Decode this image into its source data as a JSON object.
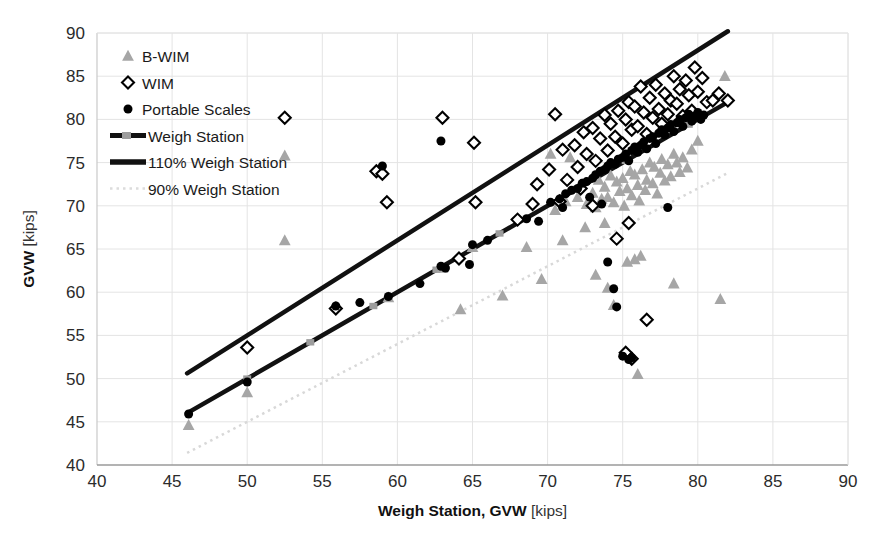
{
  "chart_data": {
    "type": "scatter",
    "title": "",
    "xlabel": "Weigh Station, GVW",
    "xlabel_unit": "[kips]",
    "ylabel": "GVW",
    "ylabel_unit": "[kips]",
    "xlim": [
      40,
      90
    ],
    "ylim": [
      40,
      90
    ],
    "xticks": [
      40,
      45,
      50,
      55,
      60,
      65,
      70,
      75,
      80,
      85,
      90
    ],
    "yticks": [
      40,
      45,
      50,
      55,
      60,
      65,
      70,
      75,
      80,
      85,
      90
    ],
    "grid": true,
    "legend_position": "upper-left",
    "legend": [
      {
        "label": "B-WIM",
        "marker": "triangle",
        "color": "#a6a6a6"
      },
      {
        "label": "WIM",
        "marker": "diamond-open",
        "color": "#000000"
      },
      {
        "label": "Portable Scales",
        "marker": "circle-filled",
        "color": "#000000"
      },
      {
        "label": "Weigh Station",
        "marker": "line-marker",
        "color": "#000000"
      },
      {
        "label": "110% Weigh Station",
        "marker": "line-thick",
        "color": "#000000"
      },
      {
        "label": "90% Weigh Station",
        "marker": "line-dotted",
        "color": "#d0d0d0"
      }
    ],
    "reference_lines": [
      {
        "name": "Weigh Station",
        "slope": 1.0,
        "intercept": 0,
        "x_range": [
          46,
          82
        ],
        "style": "solid-marker",
        "color": "#111111",
        "width": 4.5
      },
      {
        "name": "110% Weigh Station",
        "slope": 1.1,
        "intercept": 0,
        "x_range": [
          46,
          82
        ],
        "style": "solid",
        "color": "#111111",
        "width": 4.5
      },
      {
        "name": "90% Weigh Station",
        "slope": 0.9,
        "intercept": 0,
        "x_range": [
          46,
          82
        ],
        "style": "dotted",
        "color": "#d8d8d8",
        "width": 2.5
      }
    ],
    "series": [
      {
        "name": "B-WIM",
        "marker": "triangle",
        "color": "#a6a6a6",
        "points": [
          [
            46.1,
            44.6
          ],
          [
            50.0,
            48.4
          ],
          [
            52.5,
            66.0
          ],
          [
            52.5,
            75.8
          ],
          [
            59.4,
            59.4
          ],
          [
            63.0,
            62.8
          ],
          [
            65.0,
            65.2
          ],
          [
            68.6,
            65.2
          ],
          [
            70.2,
            76.0
          ],
          [
            70.5,
            69.5
          ],
          [
            71.2,
            70.5
          ],
          [
            71.5,
            75.6
          ],
          [
            72.0,
            71.0
          ],
          [
            72.3,
            72.5
          ],
          [
            72.6,
            70.2
          ],
          [
            73.0,
            71.5
          ],
          [
            73.2,
            69.8
          ],
          [
            73.4,
            73.0
          ],
          [
            73.6,
            70.8
          ],
          [
            73.8,
            72.2
          ],
          [
            74.0,
            71.0
          ],
          [
            74.2,
            73.5
          ],
          [
            74.4,
            70.4
          ],
          [
            74.6,
            72.8
          ],
          [
            74.8,
            71.7
          ],
          [
            75.0,
            73.2
          ],
          [
            75.1,
            70.0
          ],
          [
            75.3,
            72.0
          ],
          [
            75.5,
            74.0
          ],
          [
            75.6,
            71.2
          ],
          [
            75.8,
            73.6
          ],
          [
            76.0,
            72.4
          ],
          [
            76.1,
            70.6
          ],
          [
            76.3,
            74.2
          ],
          [
            76.5,
            71.8
          ],
          [
            76.6,
            73.0
          ],
          [
            76.8,
            75.0
          ],
          [
            77.0,
            72.6
          ],
          [
            77.1,
            74.5
          ],
          [
            77.3,
            71.4
          ],
          [
            77.5,
            73.8
          ],
          [
            77.6,
            75.4
          ],
          [
            77.8,
            72.9
          ],
          [
            78.0,
            74.8
          ],
          [
            78.2,
            73.4
          ],
          [
            78.4,
            76.0
          ],
          [
            78.6,
            75.0
          ],
          [
            78.8,
            73.9
          ],
          [
            79.0,
            75.6
          ],
          [
            79.3,
            74.4
          ],
          [
            79.6,
            76.5
          ],
          [
            80.0,
            77.5
          ],
          [
            81.8,
            85.0
          ],
          [
            73.2,
            62.0
          ],
          [
            74.0,
            60.5
          ],
          [
            74.4,
            58.5
          ],
          [
            75.3,
            63.5
          ],
          [
            75.8,
            63.8
          ],
          [
            76.2,
            64.2
          ],
          [
            76.0,
            50.5
          ],
          [
            78.4,
            61.0
          ],
          [
            81.5,
            59.2
          ],
          [
            72.5,
            67.5
          ],
          [
            73.8,
            68.0
          ],
          [
            71.0,
            66.0
          ],
          [
            69.6,
            61.5
          ],
          [
            67.0,
            59.6
          ],
          [
            64.2,
            58.0
          ]
        ]
      },
      {
        "name": "WIM",
        "marker": "diamond-open",
        "color": "#000000",
        "points": [
          [
            50.0,
            53.6
          ],
          [
            52.5,
            80.2
          ],
          [
            55.9,
            58.1
          ],
          [
            58.6,
            74.0
          ],
          [
            59.0,
            73.7
          ],
          [
            59.3,
            70.4
          ],
          [
            63.0,
            80.2
          ],
          [
            64.1,
            63.9
          ],
          [
            65.1,
            77.3
          ],
          [
            65.2,
            70.4
          ],
          [
            68.0,
            68.4
          ],
          [
            69.3,
            72.5
          ],
          [
            70.1,
            74.2
          ],
          [
            70.5,
            80.6
          ],
          [
            71.0,
            76.5
          ],
          [
            71.3,
            73.0
          ],
          [
            71.8,
            77.0
          ],
          [
            72.0,
            74.5
          ],
          [
            72.4,
            78.5
          ],
          [
            72.6,
            76.0
          ],
          [
            73.0,
            79.0
          ],
          [
            73.2,
            75.2
          ],
          [
            73.5,
            77.8
          ],
          [
            73.8,
            80.5
          ],
          [
            74.0,
            76.4
          ],
          [
            74.2,
            79.5
          ],
          [
            74.5,
            78.0
          ],
          [
            74.7,
            81.0
          ],
          [
            75.0,
            77.2
          ],
          [
            75.2,
            80.0
          ],
          [
            75.4,
            82.0
          ],
          [
            75.6,
            78.8
          ],
          [
            75.8,
            81.5
          ],
          [
            76.0,
            79.2
          ],
          [
            76.2,
            83.8
          ],
          [
            76.4,
            80.8
          ],
          [
            76.6,
            78.3
          ],
          [
            76.8,
            82.5
          ],
          [
            77.0,
            80.2
          ],
          [
            77.2,
            84.0
          ],
          [
            77.4,
            81.2
          ],
          [
            77.6,
            79.5
          ],
          [
            77.8,
            83.0
          ],
          [
            78.0,
            80.6
          ],
          [
            78.2,
            82.2
          ],
          [
            78.4,
            85.0
          ],
          [
            78.6,
            81.8
          ],
          [
            78.8,
            83.5
          ],
          [
            79.0,
            80.4
          ],
          [
            79.2,
            84.5
          ],
          [
            79.4,
            82.8
          ],
          [
            79.6,
            81.0
          ],
          [
            79.8,
            86.0
          ],
          [
            80.0,
            83.2
          ],
          [
            80.3,
            84.8
          ],
          [
            80.6,
            82.0
          ],
          [
            81.0,
            82.2
          ],
          [
            81.4,
            83.0
          ],
          [
            82.0,
            82.2
          ],
          [
            74.6,
            66.2
          ],
          [
            75.4,
            68.0
          ],
          [
            76.6,
            56.8
          ],
          [
            75.2,
            53.0
          ],
          [
            75.6,
            52.3
          ],
          [
            73.0,
            70.0
          ],
          [
            72.2,
            72.0
          ],
          [
            70.8,
            70.5
          ],
          [
            69.0,
            70.2
          ]
        ]
      },
      {
        "name": "Portable Scales",
        "marker": "circle-filled",
        "color": "#000000",
        "points": [
          [
            46.1,
            45.9
          ],
          [
            50.0,
            49.6
          ],
          [
            55.9,
            58.4
          ],
          [
            59.4,
            59.5
          ],
          [
            62.9,
            63.0
          ],
          [
            63.2,
            62.8
          ],
          [
            65.0,
            65.5
          ],
          [
            68.6,
            68.5
          ],
          [
            70.2,
            70.4
          ],
          [
            70.8,
            70.8
          ],
          [
            71.2,
            71.4
          ],
          [
            71.6,
            71.8
          ],
          [
            72.0,
            72.0
          ],
          [
            72.3,
            72.6
          ],
          [
            72.6,
            72.8
          ],
          [
            73.0,
            73.2
          ],
          [
            73.2,
            73.6
          ],
          [
            73.5,
            74.0
          ],
          [
            73.8,
            74.2
          ],
          [
            74.0,
            74.6
          ],
          [
            74.2,
            75.0
          ],
          [
            74.5,
            74.8
          ],
          [
            74.7,
            75.4
          ],
          [
            75.0,
            75.6
          ],
          [
            75.2,
            76.0
          ],
          [
            75.4,
            75.2
          ],
          [
            75.6,
            76.4
          ],
          [
            75.8,
            76.8
          ],
          [
            76.0,
            76.2
          ],
          [
            76.2,
            77.0
          ],
          [
            76.4,
            77.4
          ],
          [
            76.6,
            76.6
          ],
          [
            76.8,
            77.8
          ],
          [
            77.0,
            78.0
          ],
          [
            77.2,
            77.2
          ],
          [
            77.4,
            78.4
          ],
          [
            77.6,
            78.8
          ],
          [
            77.8,
            78.2
          ],
          [
            78.0,
            79.0
          ],
          [
            78.2,
            79.4
          ],
          [
            78.4,
            78.6
          ],
          [
            78.6,
            79.6
          ],
          [
            78.8,
            80.0
          ],
          [
            79.0,
            79.2
          ],
          [
            79.2,
            80.2
          ],
          [
            79.4,
            80.6
          ],
          [
            79.6,
            79.8
          ],
          [
            79.8,
            80.4
          ],
          [
            80.0,
            80.8
          ],
          [
            80.2,
            80.0
          ],
          [
            80.4,
            80.5
          ],
          [
            59.0,
            74.6
          ],
          [
            62.9,
            77.5
          ],
          [
            74.0,
            63.5
          ],
          [
            74.4,
            60.4
          ],
          [
            74.6,
            58.3
          ],
          [
            75.0,
            52.6
          ],
          [
            75.4,
            52.2
          ],
          [
            75.6,
            52.4
          ],
          [
            78.0,
            69.8
          ],
          [
            73.6,
            70.2
          ],
          [
            72.8,
            71.0
          ],
          [
            71.0,
            69.8
          ],
          [
            69.4,
            68.2
          ],
          [
            66.0,
            66.0
          ],
          [
            64.8,
            63.2
          ],
          [
            61.5,
            61.0
          ],
          [
            57.5,
            58.8
          ]
        ]
      }
    ]
  }
}
